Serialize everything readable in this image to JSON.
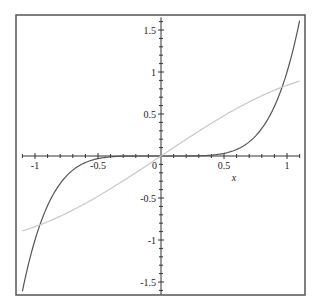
{
  "chart_data": {
    "type": "line",
    "title": "",
    "xlabel": "x",
    "ylabel": "",
    "xlim": [
      -1.1,
      1.1
    ],
    "ylim": [
      -1.65,
      1.65
    ],
    "grid": false,
    "legend": null,
    "x_ticks": [
      -1,
      -0.5,
      0.5,
      1
    ],
    "x_tick_labels": [
      "-1",
      "-0.5",
      "0.5",
      "1"
    ],
    "y_ticks": [
      -1.5,
      -1,
      -0.5,
      0.5,
      1,
      1.5
    ],
    "y_tick_labels": [
      "-1.5",
      "-1",
      "-0.5",
      "0.5",
      "1",
      "1.5"
    ],
    "origin_label": "0",
    "series": [
      {
        "name": "x^5",
        "color": "#555555",
        "x": [
          -1.1,
          -1.0,
          -0.9,
          -0.8,
          -0.7,
          -0.6,
          -0.5,
          -0.4,
          -0.3,
          -0.2,
          0,
          0.2,
          0.3,
          0.4,
          0.5,
          0.6,
          0.7,
          0.8,
          0.9,
          1.0,
          1.1
        ],
        "values": [
          -1.611,
          -1.0,
          -0.59,
          -0.328,
          -0.168,
          -0.078,
          -0.031,
          -0.01,
          -0.002,
          0.0,
          0.0,
          0.0,
          0.002,
          0.01,
          0.031,
          0.078,
          0.168,
          0.328,
          0.59,
          1.0,
          1.611
        ]
      },
      {
        "name": "sin(x)",
        "color": "#c8c8c8",
        "x": [
          -1.1,
          -1.0,
          -0.8,
          -0.6,
          -0.4,
          -0.2,
          0,
          0.2,
          0.4,
          0.6,
          0.8,
          1.0,
          1.1
        ],
        "values": [
          -0.891,
          -0.841,
          -0.717,
          -0.565,
          -0.389,
          -0.199,
          0.0,
          0.199,
          0.389,
          0.565,
          0.717,
          0.841,
          0.891
        ]
      }
    ]
  },
  "colors": {
    "frame": "#555555",
    "axes": "#333333",
    "background": "#ffffff"
  }
}
